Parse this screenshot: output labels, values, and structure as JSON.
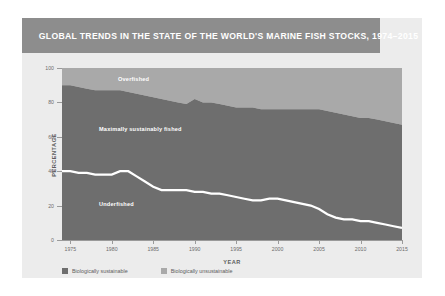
{
  "title": "GLOBAL TRENDS IN THE STATE OF THE WORLD'S MARINE FISH STOCKS, 1974–2015",
  "colors": {
    "banner": "#8d8d8d",
    "card": "#ececec",
    "plot_bg": "#ececec",
    "band_sustainable": "#6e6e6e",
    "band_unsustainable": "#a9a9a9",
    "separator": "#ffffff",
    "axis": "#9a9a9a",
    "tick_text": "#6d6d6d"
  },
  "annotations": {
    "overfished": "Overfished",
    "maximally": "Maximally sustainably fished",
    "underfished": "Underfished"
  },
  "legend": {
    "items": [
      {
        "label": "Biologically sustainable",
        "color": "#6e6e6e"
      },
      {
        "label": "Biologically unsustainable",
        "color": "#a9a9a9"
      }
    ]
  },
  "chart_data": {
    "type": "area",
    "title": "GLOBAL TRENDS IN THE STATE OF THE WORLD'S MARINE FISH STOCKS, 1974–2015",
    "xlabel": "YEAR",
    "ylabel": "PERCENTAGE",
    "xlim": [
      1974,
      2015
    ],
    "ylim": [
      0,
      100
    ],
    "ytick_values": [
      0,
      20,
      40,
      60,
      80,
      100
    ],
    "ytick_labels": [
      "0",
      "20",
      "40",
      "60",
      "80",
      "100"
    ],
    "xtick_values": [
      1975,
      1980,
      1985,
      1990,
      1995,
      2000,
      2005,
      2010,
      2015
    ],
    "xtick_labels": [
      "1975",
      "1980",
      "1985",
      "1990",
      "1995",
      "2000",
      "2005",
      "2010",
      "2015"
    ],
    "grid": false,
    "stacked": true,
    "legend_position": "bottom-left",
    "x": [
      1974,
      1975,
      1976,
      1977,
      1978,
      1979,
      1980,
      1981,
      1982,
      1983,
      1984,
      1985,
      1986,
      1987,
      1988,
      1989,
      1990,
      1991,
      1992,
      1993,
      1994,
      1995,
      1996,
      1997,
      1998,
      1999,
      2000,
      2001,
      2002,
      2003,
      2004,
      2005,
      2006,
      2007,
      2008,
      2009,
      2010,
      2011,
      2012,
      2013,
      2014,
      2015
    ],
    "series": [
      {
        "name": "Underfished",
        "legend": "Biologically sustainable",
        "color": "#6e6e6e",
        "values": [
          40,
          40,
          39,
          39,
          38,
          38,
          38,
          40,
          40,
          37,
          34,
          31,
          29,
          29,
          29,
          29,
          28,
          28,
          27,
          27,
          26,
          25,
          24,
          23,
          23,
          24,
          24,
          23,
          22,
          21,
          20,
          18,
          15,
          13,
          12,
          12,
          11,
          11,
          10,
          9,
          8,
          7
        ]
      },
      {
        "name": "Maximally sustainably fished",
        "legend": "Biologically sustainable",
        "color": "#6e6e6e",
        "values": [
          50,
          50,
          50,
          49,
          49,
          49,
          49,
          47,
          46,
          48,
          50,
          52,
          53,
          52,
          51,
          50,
          54,
          52,
          53,
          52,
          52,
          52,
          53,
          54,
          53,
          52,
          52,
          53,
          54,
          55,
          56,
          58,
          60,
          61,
          61,
          60,
          60,
          60,
          60,
          60,
          60,
          60
        ]
      },
      {
        "name": "Overfished",
        "legend": "Biologically unsustainable",
        "color": "#a9a9a9",
        "values": [
          10,
          10,
          11,
          12,
          13,
          13,
          13,
          13,
          14,
          15,
          16,
          17,
          18,
          19,
          20,
          21,
          18,
          20,
          20,
          21,
          22,
          23,
          23,
          23,
          24,
          24,
          24,
          24,
          24,
          24,
          24,
          24,
          25,
          26,
          27,
          28,
          29,
          29,
          30,
          31,
          32,
          33
        ]
      }
    ],
    "cumulative_boundaries": {
      "underfished_top": [
        40,
        40,
        39,
        39,
        38,
        38,
        38,
        40,
        40,
        37,
        34,
        31,
        29,
        29,
        29,
        29,
        28,
        28,
        27,
        27,
        26,
        25,
        24,
        23,
        23,
        24,
        24,
        23,
        22,
        21,
        20,
        18,
        15,
        13,
        12,
        12,
        11,
        11,
        10,
        9,
        8,
        7
      ],
      "maximally_top": [
        90,
        90,
        89,
        88,
        87,
        87,
        87,
        87,
        86,
        85,
        84,
        83,
        82,
        81,
        80,
        79,
        82,
        80,
        80,
        79,
        78,
        77,
        77,
        77,
        76,
        76,
        76,
        76,
        76,
        76,
        76,
        76,
        75,
        74,
        73,
        72,
        71,
        71,
        70,
        69,
        68,
        67
      ]
    }
  }
}
